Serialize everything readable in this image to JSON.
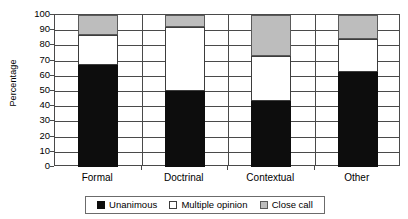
{
  "chart_data": {
    "type": "bar",
    "subtype": "stacked-100-percent",
    "title": "",
    "xlabel": "",
    "ylabel": "Percentage",
    "ylim": [
      0,
      100
    ],
    "yticks": [
      0,
      10,
      20,
      30,
      40,
      50,
      60,
      70,
      80,
      90,
      100
    ],
    "ytick_labels": [
      "0",
      "10",
      "20",
      "30",
      "40",
      "50",
      "60",
      "70",
      "80",
      "90",
      "100"
    ],
    "grid": true,
    "grid_axis": "y",
    "legend_position": "bottom",
    "categories": [
      "Formal",
      "Doctrinal",
      "Contextual",
      "Other"
    ],
    "series": [
      {
        "name": "Unanimous",
        "color": "#0d0d0d",
        "values": [
          67,
          50,
          43.5,
          62.5
        ]
      },
      {
        "name": "Multiple opinion",
        "color": "#ffffff",
        "values": [
          20,
          42,
          29.5,
          22
        ]
      },
      {
        "name": "Close call",
        "color": "#bdbdbd",
        "values": [
          13,
          8,
          27,
          15.5
        ]
      }
    ],
    "cumulative_tops": {
      "Formal": [
        67,
        87,
        100
      ],
      "Doctrinal": [
        50,
        92,
        100
      ],
      "Contextual": [
        43.5,
        73,
        100
      ],
      "Other": [
        62.5,
        84.5,
        100
      ]
    }
  },
  "legend": {
    "items": [
      {
        "label": "Unanimous",
        "swatch": "black-swatch-icon"
      },
      {
        "label": "Multiple opinion",
        "swatch": "white-swatch-icon"
      },
      {
        "label": "Close call",
        "swatch": "gray-swatch-icon"
      }
    ]
  },
  "axis": {
    "y_title": "Percentage"
  }
}
